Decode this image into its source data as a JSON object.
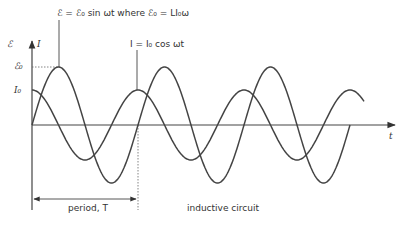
{
  "diagram": {
    "title_sine": "ℰ = ℰ₀ sin ωt  where ℰ₀ = LI₀ω",
    "title_cos": "I = I₀ cos ωt",
    "y_axis_label": "ℰ ▲ I",
    "y_label_emf": "ℰ",
    "y_label_current": "I",
    "tick_emf0": "ℰ₀",
    "tick_i0": "I₀",
    "x_axis_label": "t",
    "period_label": "period, T",
    "caption": "inductive circuit",
    "colors": {
      "curve": "#444444",
      "axis": "#444444",
      "text": "#333333"
    }
  },
  "chart_data": {
    "type": "line",
    "xlabel": "t",
    "ylabel": "ℰ, I",
    "series": [
      {
        "name": "ℰ = ℰ₀ sin ωt",
        "amplitude": 1.0,
        "phase": "sin",
        "periods_shown": 3
      },
      {
        "name": "I = I₀ cos ωt",
        "amplitude": 0.6,
        "phase": "cos",
        "periods_shown": 3.125
      }
    ],
    "annotations": [
      "ℰ₀ = LI₀ω",
      "period, T",
      "inductive circuit"
    ],
    "grid": false
  }
}
